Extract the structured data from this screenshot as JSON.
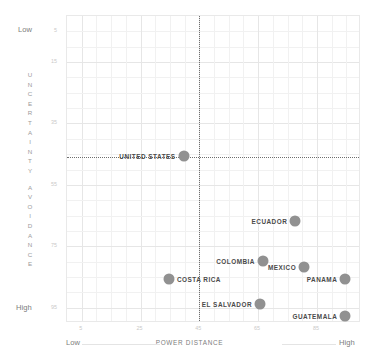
{
  "axes": {
    "x": {
      "title": "POWER DISTANCE",
      "low_label": "Low",
      "high_label": "High",
      "ticks": [
        "5",
        "25",
        "45",
        "65",
        "85"
      ],
      "tick_values": [
        5,
        25,
        45,
        65,
        85
      ],
      "range": [
        0,
        100
      ]
    },
    "y": {
      "title_letters": "U N C E R T A I N T Y  A V O I D A N C E",
      "title": "UNCERTAINTY AVOIDANCE",
      "low_label": "Low",
      "high_label": "High",
      "ticks": [
        "5",
        "15",
        "35",
        "55",
        "75",
        "95"
      ],
      "tick_values": [
        5,
        15,
        35,
        55,
        75,
        95
      ],
      "range": [
        0,
        100
      ]
    }
  },
  "colors": {
    "marker": "#919191",
    "label": "#4a4a4a",
    "grid": "#f1f1f1",
    "grid_major": "#e6e6e6",
    "divider": "#6e6e6e",
    "tick": "#c9c9c9",
    "caption": "#7d7d7d"
  },
  "quadrant_dividers": {
    "x": 45,
    "y": 46
  },
  "chart_data": {
    "type": "scatter",
    "title": "",
    "xlabel": "POWER DISTANCE",
    "ylabel": "UNCERTAINTY AVOIDANCE",
    "xlim": [
      0,
      100
    ],
    "ylim": [
      0,
      100
    ],
    "y_inverted": true,
    "grid": true,
    "legend": "none",
    "points": [
      {
        "name": "UNITED STATES",
        "x": 40,
        "y": 46,
        "label_side": "left"
      },
      {
        "name": "ECUADOR",
        "x": 78,
        "y": 67,
        "label_side": "left"
      },
      {
        "name": "COLOMBIA",
        "x": 67,
        "y": 80,
        "label_side": "left"
      },
      {
        "name": "MEXICO",
        "x": 81,
        "y": 82,
        "label_side": "left"
      },
      {
        "name": "COSTA RICA",
        "x": 35,
        "y": 86,
        "label_side": "right"
      },
      {
        "name": "PANAMA",
        "x": 95,
        "y": 86,
        "label_side": "left"
      },
      {
        "name": "EL SALVADOR",
        "x": 66,
        "y": 94,
        "label_side": "left"
      },
      {
        "name": "GUATEMALA",
        "x": 95,
        "y": 98,
        "label_side": "left"
      }
    ]
  }
}
